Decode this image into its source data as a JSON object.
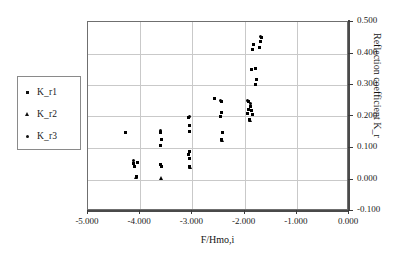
{
  "chart_data": {
    "type": "scatter",
    "title": "",
    "xlabel": "F/Hmo,i",
    "ylabel": "Reflection coefficient K_r",
    "xlim": [
      -5.0,
      0.0
    ],
    "ylim": [
      -0.1,
      0.5
    ],
    "xticks": [
      "-5.000",
      "-4.000",
      "-3.000",
      "-2.000",
      "-1.000",
      "0.000"
    ],
    "xtick_values": [
      -5.0,
      -4.0,
      -3.0,
      -2.0,
      -1.0,
      0.0
    ],
    "yticks": [
      "-0.100",
      "0.000",
      "0.100",
      "0.200",
      "0.300",
      "0.400",
      "0.500"
    ],
    "ytick_values": [
      -0.1,
      0.0,
      0.1,
      0.2,
      0.3,
      0.4,
      0.5
    ],
    "grid": true,
    "legend_position": "outside-left",
    "series": [
      {
        "name": "K_r1",
        "marker": "square",
        "color": "#000000",
        "points": [
          [
            -4.12,
            0.052
          ],
          [
            -4.1,
            0.04
          ],
          [
            -4.06,
            0.055
          ],
          [
            -4.08,
            0.01
          ],
          [
            -3.62,
            0.15
          ],
          [
            -3.6,
            0.128
          ],
          [
            -3.61,
            0.108
          ],
          [
            -3.62,
            0.048
          ],
          [
            -3.6,
            0.042
          ],
          [
            -4.28,
            0.148
          ],
          [
            -3.07,
            0.198
          ],
          [
            -3.06,
            0.172
          ],
          [
            -3.05,
            0.152
          ],
          [
            -3.06,
            0.088
          ],
          [
            -3.07,
            0.078
          ],
          [
            -3.05,
            0.068
          ],
          [
            -3.06,
            0.042
          ],
          [
            -2.45,
            0.248
          ],
          [
            -2.44,
            0.212
          ],
          [
            -2.46,
            0.2
          ],
          [
            -2.43,
            0.148
          ],
          [
            -2.45,
            0.128
          ],
          [
            -2.58,
            0.258
          ],
          [
            -1.93,
            0.248
          ],
          [
            -1.92,
            0.222
          ],
          [
            -1.94,
            0.208
          ],
          [
            -1.88,
            0.232
          ],
          [
            -1.86,
            0.218
          ],
          [
            -1.85,
            0.205
          ],
          [
            -1.9,
            0.19
          ],
          [
            -1.7,
            0.438
          ],
          [
            -1.68,
            0.452
          ],
          [
            -1.72,
            0.418
          ],
          [
            -1.82,
            0.428
          ],
          [
            -1.84,
            0.412
          ],
          [
            -1.86,
            0.348
          ],
          [
            -1.8,
            0.352
          ],
          [
            -1.78,
            0.318
          ],
          [
            -1.79,
            0.302
          ]
        ]
      },
      {
        "name": "K_r2",
        "marker": "triangle",
        "color": "#000000",
        "points": [
          [
            -4.09,
            0.008
          ],
          [
            -3.61,
            0.004
          ],
          [
            -3.06,
            0.04
          ],
          [
            -2.44,
            0.124
          ],
          [
            -1.91,
            0.19
          ]
        ]
      },
      {
        "name": "K_r3",
        "marker": "diamond",
        "color": "#000000",
        "points": [
          [
            -4.12,
            0.06
          ],
          [
            -3.62,
            0.155
          ],
          [
            -3.06,
            0.2
          ],
          [
            -2.46,
            0.252
          ],
          [
            -1.95,
            0.25
          ],
          [
            -1.88,
            0.24
          ],
          [
            -1.7,
            0.455
          ]
        ]
      }
    ]
  },
  "legend": {
    "items": [
      {
        "label": "K_r1",
        "marker": "square"
      },
      {
        "label": "K_r2",
        "marker": "triangle"
      },
      {
        "label": "K_r3",
        "marker": "diamond"
      }
    ]
  }
}
